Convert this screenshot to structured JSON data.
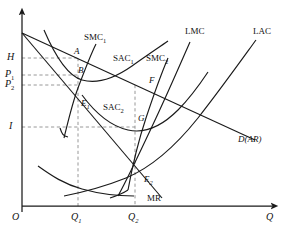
{
  "figure": {
    "type": "economics-cost-curve-diagram",
    "axes": {
      "x_label": "Q",
      "y_label": "",
      "origin_label": "O",
      "x_ticks": [
        {
          "label": "Q",
          "subscript": "1",
          "x": 78
        },
        {
          "label": "Q",
          "subscript": "2",
          "x": 135
        }
      ],
      "y_ticks": [
        {
          "label": "H",
          "subscript": "",
          "y": 58
        },
        {
          "label": "P",
          "subscript": "1",
          "y": 75
        },
        {
          "label": "P",
          "subscript": "2",
          "y": 85
        },
        {
          "label": "I",
          "subscript": "",
          "y": 127
        }
      ]
    },
    "curve_labels": [
      {
        "name": "smc1-label",
        "text": "SMC",
        "subscript": "1",
        "x": 84,
        "y": 33
      },
      {
        "name": "sac1-label",
        "text": "SAC",
        "subscript": "1",
        "x": 113,
        "y": 54
      },
      {
        "name": "smc2-label",
        "text": "SMC",
        "subscript": "2",
        "x": 146,
        "y": 54
      },
      {
        "name": "lmc-label",
        "text": "LMC",
        "subscript": "",
        "x": 185,
        "y": 27
      },
      {
        "name": "lac-label",
        "text": "LAC",
        "subscript": "",
        "x": 253,
        "y": 27
      },
      {
        "name": "sac2-label",
        "text": "SAC",
        "subscript": "2",
        "x": 103,
        "y": 103
      },
      {
        "name": "demand-label",
        "text": "D(AR)",
        "subscript": "",
        "x": 238,
        "y": 135
      },
      {
        "name": "mr-label",
        "text": "MR",
        "subscript": "",
        "x": 147,
        "y": 194
      }
    ],
    "point_labels": [
      {
        "name": "point-a",
        "text": "A",
        "subscript": "",
        "x": 74,
        "y": 47
      },
      {
        "name": "point-b",
        "text": "B",
        "subscript": "",
        "x": 78,
        "y": 66
      },
      {
        "name": "point-e1",
        "text": "E",
        "subscript": "1",
        "x": 81,
        "y": 99
      },
      {
        "name": "point-f",
        "text": "F",
        "subscript": "",
        "x": 149,
        "y": 76
      },
      {
        "name": "point-g",
        "text": "G",
        "subscript": "",
        "x": 138,
        "y": 114
      },
      {
        "name": "point-e2",
        "text": "E",
        "subscript": "2",
        "x": 144,
        "y": 175
      }
    ],
    "colors": {
      "stroke": "#1a1a1a",
      "dashed": "#8a8a8a",
      "background": "#ffffff"
    }
  }
}
